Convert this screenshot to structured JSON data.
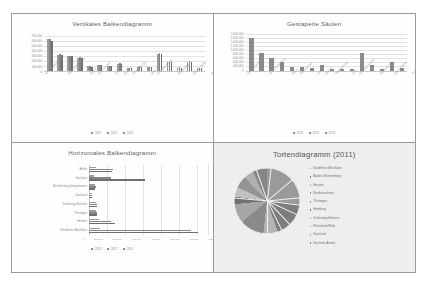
{
  "document": {
    "background": "#ffffff",
    "sheet_border": "#9a9a9a"
  },
  "charts": [
    {
      "id": "vertical-bar",
      "title": "Vertikales Balkendiagramm",
      "legend": [
        "2011",
        "2012",
        "2013"
      ],
      "y_ticks": [
        "700.000",
        "600.000",
        "500.000",
        "400.000",
        "300.000",
        "200.000",
        "100.000",
        "0"
      ]
    },
    {
      "id": "stacked-column",
      "title": "Gestapelte Säulen",
      "legend": [
        "2011",
        "2012",
        "2013"
      ],
      "y_ticks": [
        "1.800.000",
        "1.600.000",
        "1.400.000",
        "1.200.000",
        "1.000.000",
        "800.000",
        "600.000",
        "400.000",
        "200.000",
        "0"
      ]
    },
    {
      "id": "horizontal-bar",
      "title": "Horizontales Balkendiagramm",
      "legend": [
        "2013",
        "2012",
        "2011"
      ],
      "x_ticks": [
        "0",
        "100.000",
        "200.000",
        "300.000",
        "400.000",
        "500.000",
        "600.000",
        "700.000"
      ]
    },
    {
      "id": "pie",
      "title": "Tortendiagramm (2011)"
    }
  ],
  "chart_data": [
    {
      "type": "bar",
      "id": "vertical-bar",
      "title": "Vertikales Balkendiagramm",
      "xlabel": "",
      "ylabel": "",
      "ylim": [
        0,
        700000
      ],
      "grid": true,
      "legend_position": "bottom",
      "categories": [
        "Nordrhein-Westfalen",
        "Baden-Württemberg",
        "Bayern",
        "Niedersachsen",
        "Hessen",
        "Sachsen",
        "Rheinland-Pfalz",
        "Berlin",
        "Schleswig-Holstein",
        "Brandenburg",
        "Sachsen-Anhalt",
        "Thüringen",
        "Hamburg",
        "Mecklenburg-Vorpommern",
        "Saarland",
        "Bremen"
      ],
      "series": [
        {
          "name": "2011",
          "values": [
            640000,
            330000,
            300000,
            270000,
            95000,
            120000,
            100000,
            150000,
            60000,
            90000,
            80000,
            350000,
            175000,
            70000,
            190000,
            60000
          ]
        },
        {
          "name": "2012",
          "values": [
            650000,
            335000,
            305000,
            275000,
            95000,
            125000,
            100000,
            155000,
            60000,
            92000,
            82000,
            355000,
            180000,
            72000,
            195000,
            62000
          ]
        },
        {
          "name": "2013",
          "values": [
            600000,
            330000,
            300000,
            270000,
            90000,
            120000,
            95000,
            150000,
            58000,
            90000,
            80000,
            350000,
            175000,
            70000,
            190000,
            60000
          ]
        }
      ]
    },
    {
      "type": "bar",
      "id": "stacked-column",
      "title": "Gestapelte Säulen",
      "xlabel": "",
      "ylabel": "",
      "ylim": [
        0,
        1800000
      ],
      "grid": true,
      "legend_position": "bottom",
      "categories": [
        "Nordrhein-Westfalen",
        "Baden-Württemberg",
        "Bayern",
        "Niedersachsen",
        "Hessen",
        "Sachsen",
        "Rheinland-Pfalz",
        "Berlin",
        "Schleswig-Holstein",
        "Brandenburg",
        "Sachsen-Anhalt",
        "Thüringen",
        "Hamburg",
        "Mecklenburg-Vorpommern",
        "Saarland",
        "Bremen"
      ],
      "values": [
        1620000,
        900000,
        650000,
        450000,
        190000,
        200000,
        170000,
        300000,
        120000,
        110000,
        100000,
        880000,
        280000,
        110000,
        420000,
        130000
      ],
      "stacked": true
    },
    {
      "type": "bar",
      "id": "horizontal-bar",
      "title": "Horizontales Balkendiagramm",
      "orientation": "horizontal",
      "xlabel": "",
      "ylabel": "",
      "xlim": [
        0,
        700000
      ],
      "grid": true,
      "legend_position": "bottom",
      "categories": [
        "Berlin",
        "Sachsen",
        "Mecklenburg-Vorpommern",
        "Saarland",
        "Schleswig-Holstein",
        "Thüringen",
        "Hessen",
        "Nordrhein-Westfalen"
      ],
      "series": [
        {
          "name": "2013",
          "values": [
            40000,
            30000,
            35000,
            18000,
            42000,
            40000,
            58000,
            62000
          ]
        },
        {
          "name": "2012",
          "values": [
            140000,
            130000,
            40000,
            20000,
            48000,
            48000,
            130000,
            600000
          ]
        },
        {
          "name": "2011",
          "values": [
            135000,
            330000,
            38000,
            19000,
            46000,
            46000,
            150000,
            640000
          ]
        }
      ]
    },
    {
      "type": "pie",
      "id": "pie",
      "title": "Tortendiagramm (2011)",
      "legend_position": "right",
      "labels": [
        "Nordrhein-Westfalen",
        "Baden-Württemberg",
        "Hessen",
        "Niedersachsen",
        "Thüringen",
        "Hamburg",
        "Schleswig-Holstein",
        "Rheinland-Pfalz",
        "Saarland",
        "Sachsen-Anhalt"
      ],
      "values": [
        22,
        15,
        6,
        10,
        8,
        3,
        4,
        5,
        4,
        6
      ]
    }
  ]
}
